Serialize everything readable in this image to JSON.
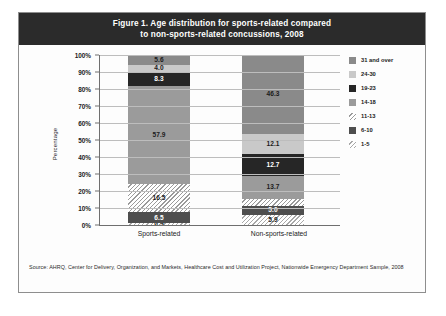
{
  "figure": {
    "title_line1": "Figure 1.   Age distribution for sports-related compared",
    "title_line2": "to non-sports-related concussions, 2008",
    "source": "Source: AHRQ, Center for Delivery, Organization, and Markets, Healthcare Cost and Utilization Project, Nationwide Emergency Department Sample, 2008"
  },
  "chart_data": {
    "type": "bar",
    "stacked": true,
    "title": "Figure 1.   Age distribution for sports-related compared to non-sports-related concussions, 2008",
    "xlabel": "",
    "ylabel": "Percentage",
    "ylim": [
      0,
      100
    ],
    "yticks": [
      "0%",
      "10%",
      "20%",
      "30%",
      "40%",
      "50%",
      "60%",
      "70%",
      "80%",
      "90%",
      "100%"
    ],
    "grid": true,
    "legend_position": "right",
    "categories": [
      "Sports-related",
      "Non-sports-related"
    ],
    "series": [
      {
        "name": "1-5",
        "color": "#f2f2f2",
        "pattern": "hatch",
        "values": [
          0.9,
          5.9
        ],
        "labels": [
          "0.9",
          "5.9"
        ]
      },
      {
        "name": "6-10",
        "color": "#4e4e4e",
        "pattern": "solid",
        "values": [
          6.5,
          5.0
        ],
        "labels": [
          "6.5",
          "5.0"
        ]
      },
      {
        "name": "11-13",
        "color": "#ededed",
        "pattern": "hatch",
        "values": [
          16.5,
          4.3
        ],
        "labels": [
          "16.5",
          ""
        ]
      },
      {
        "name": "14-18",
        "color": "#9b9b9b",
        "pattern": "solid",
        "values": [
          57.9,
          13.7
        ],
        "labels": [
          "57.9",
          "13.7"
        ]
      },
      {
        "name": "19-23",
        "color": "#262626",
        "pattern": "solid",
        "values": [
          8.3,
          12.7
        ],
        "labels": [
          "8.3",
          "12.7"
        ]
      },
      {
        "name": "24-30",
        "color": "#c9c9c9",
        "pattern": "solid",
        "values": [
          4.0,
          12.1
        ],
        "labels": [
          "4.0",
          "12.1"
        ]
      },
      {
        "name": "31 and over",
        "color": "#8a8a8a",
        "pattern": "solid",
        "values": [
          5.6,
          46.3
        ],
        "labels": [
          "5.6",
          "46.3"
        ]
      }
    ]
  },
  "legend": {
    "items": [
      {
        "label": "31 and over"
      },
      {
        "label": "24-30"
      },
      {
        "label": "19-23"
      },
      {
        "label": "14-18"
      },
      {
        "label": "11-13"
      },
      {
        "label": "6-10"
      },
      {
        "label": "1-5"
      }
    ]
  }
}
